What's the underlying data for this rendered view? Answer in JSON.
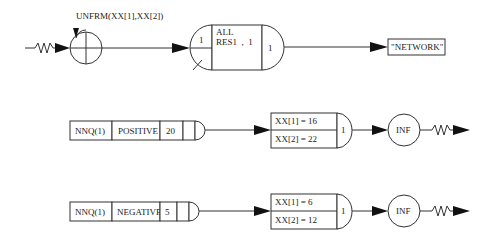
{
  "diagram": {
    "type": "queueing-network",
    "row1": {
      "source": {
        "label": "UNFRM(XX[1],XX[2])",
        "icon": "source-node-icon"
      },
      "resource_node": {
        "left_value": "1",
        "line1": "ALL",
        "line2": "RES1  ,  1",
        "right_value": "1"
      },
      "output": {
        "label": "\"NETWORK\""
      }
    },
    "row2": {
      "queue": {
        "name": "NNQ(1)",
        "type": "POSITIVE",
        "capacity": "20"
      },
      "assign": {
        "line1": "XX[1] = 16",
        "line2": "XX[2] = 22",
        "value": "1"
      },
      "server": {
        "label": "INF"
      }
    },
    "row3": {
      "queue": {
        "name": "NNQ(1)",
        "type": "NEGATIVE",
        "capacity": "5"
      },
      "assign": {
        "line1": "XX[1] = 6",
        "line2": "XX[2] = 12",
        "value": "1"
      },
      "server": {
        "label": "INF"
      }
    },
    "colors": {
      "line": "#333333",
      "arrow": "#111111",
      "background": "#ffffff"
    }
  }
}
